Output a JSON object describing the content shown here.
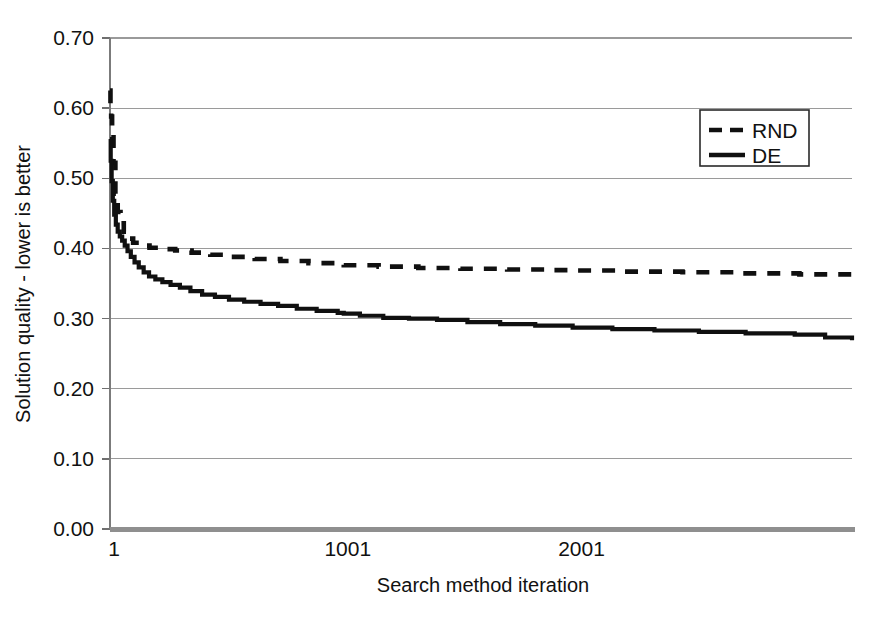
{
  "chart_data": {
    "type": "line",
    "title": "",
    "xlabel": "Search method iteration",
    "ylabel": "Solution quality - lower is better",
    "xlim": [
      1,
      3175
    ],
    "ylim": [
      0.0,
      0.7
    ],
    "xticks": [
      1,
      1001,
      2001
    ],
    "xtick_labels": [
      "1",
      "1001",
      "2001"
    ],
    "yticks": [
      0.0,
      0.1,
      0.2,
      0.3,
      0.4,
      0.5,
      0.6,
      0.7
    ],
    "ytick_labels": [
      "0.00",
      "0.10",
      "0.20",
      "0.30",
      "0.40",
      "0.50",
      "0.60",
      "0.70"
    ],
    "grid": true,
    "legend_position": "upper-right",
    "legend_entries": [
      "RND",
      "DE"
    ],
    "series": [
      {
        "name": "RND",
        "style": "dashed",
        "color": "#101010",
        "x": [
          1,
          3,
          6,
          10,
          16,
          24,
          34,
          46,
          60,
          78,
          100,
          130,
          170,
          220,
          280,
          350,
          430,
          520,
          620,
          730,
          850,
          1001,
          1150,
          1320,
          1500,
          1700,
          1900,
          2001,
          2200,
          2450,
          2700,
          2950,
          3175
        ],
        "y": [
          0.625,
          0.605,
          0.588,
          0.565,
          0.522,
          0.478,
          0.452,
          0.436,
          0.424,
          0.414,
          0.408,
          0.404,
          0.401,
          0.399,
          0.397,
          0.394,
          0.391,
          0.388,
          0.385,
          0.382,
          0.379,
          0.376,
          0.374,
          0.372,
          0.371,
          0.37,
          0.369,
          0.3685,
          0.367,
          0.366,
          0.3645,
          0.363,
          0.3615
        ]
      },
      {
        "name": "DE",
        "style": "solid",
        "color": "#101010",
        "x": [
          1,
          4,
          8,
          13,
          19,
          26,
          34,
          43,
          53,
          64,
          76,
          90,
          106,
          124,
          145,
          168,
          195,
          225,
          260,
          300,
          345,
          395,
          450,
          510,
          575,
          645,
          720,
          800,
          885,
          975,
          1001,
          1070,
          1170,
          1280,
          1400,
          1530,
          1670,
          1820,
          1980,
          2001,
          2150,
          2330,
          2520,
          2720,
          2930,
          3060,
          3175
        ],
        "y": [
          0.556,
          0.525,
          0.496,
          0.468,
          0.448,
          0.434,
          0.424,
          0.417,
          0.411,
          0.404,
          0.396,
          0.388,
          0.38,
          0.373,
          0.366,
          0.36,
          0.356,
          0.352,
          0.348,
          0.344,
          0.339,
          0.334,
          0.331,
          0.327,
          0.324,
          0.321,
          0.318,
          0.314,
          0.311,
          0.308,
          0.307,
          0.304,
          0.301,
          0.3,
          0.298,
          0.295,
          0.292,
          0.29,
          0.287,
          0.287,
          0.285,
          0.283,
          0.281,
          0.279,
          0.277,
          0.273,
          0.269
        ]
      }
    ]
  },
  "legend": {
    "items": [
      {
        "label": "RND",
        "style": "dashed"
      },
      {
        "label": "DE",
        "style": "solid"
      }
    ]
  },
  "axes": {
    "x_title": "Search method iteration",
    "y_title": "Solution quality - lower is better"
  },
  "colors": {
    "series": "#101010",
    "grid": "#9a9a9a",
    "axis": "#7b7b7b",
    "baseline": "#8f8f8f",
    "background": "#ffffff"
  }
}
